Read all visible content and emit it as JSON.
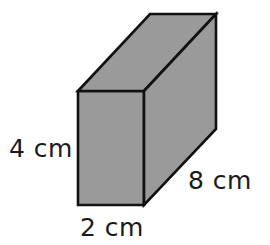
{
  "figure": {
    "name": "rectangular-prism-diagram",
    "shape_kind": "cuboid",
    "projection": "oblique",
    "colors": {
      "face_fill": "#9a9a9a",
      "edge_stroke": "#111111",
      "background": "#ffffff",
      "label_color": "#1a1a1a"
    },
    "edge_width": 2.6
  },
  "labels": {
    "height": "4 cm",
    "width": "2 cm",
    "depth": "8 cm"
  },
  "geometry": {
    "front_face": "78,91 144,91 144,205 78,205",
    "top_face": "78,91 150,14 216,14 144,91",
    "side_face": "144,91 216,14 216,129 144,205"
  }
}
